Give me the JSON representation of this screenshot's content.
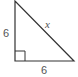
{
  "diagram": {
    "type": "right-triangle",
    "stroke_color": "#333333",
    "label_color": "#555555",
    "vertices": {
      "top": [
        15,
        1
      ],
      "right_angle": [
        15,
        61
      ],
      "bottom_right": [
        74,
        61
      ]
    },
    "labels": {
      "left_leg": "6",
      "bottom_leg": "6",
      "hypotenuse": "x"
    },
    "right_angle_marker": true
  }
}
